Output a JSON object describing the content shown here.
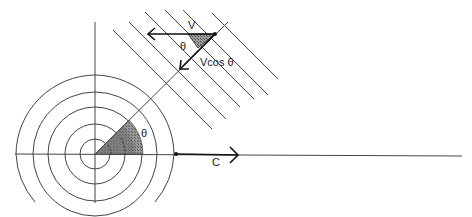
{
  "diagram": {
    "labels": {
      "velocity": "V",
      "angle_top": "θ",
      "component": "Vcos θ",
      "angle_origin": "θ",
      "speed_of_sound": "C"
    },
    "colors": {
      "line": "#333333",
      "shade": "#7a7a7a",
      "background": "#ffffff"
    }
  }
}
